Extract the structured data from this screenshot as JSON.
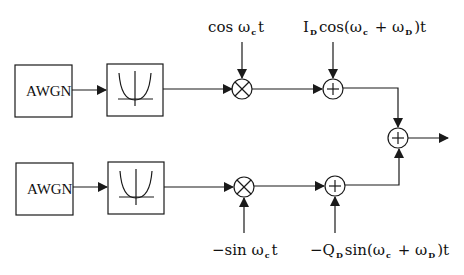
{
  "diagram": {
    "type": "block-diagram",
    "colors": {
      "stroke": "#1a1a1a",
      "background": "#ffffff"
    },
    "top_branch": {
      "noise_source": {
        "label": "AWGN"
      },
      "filter": {
        "icon": "bandpass-filter-icon"
      },
      "mixer": {
        "symbol": "×",
        "input_label": {
          "pre": "cos ω",
          "sub": "c",
          "post": "t"
        }
      },
      "adder": {
        "symbol": "+",
        "input_label": {
          "p1": "I",
          "s1": "D",
          "p2": "cos(ω",
          "s2": "c",
          "p3": " + ω",
          "s3": "D",
          "p4": ")t"
        }
      }
    },
    "bottom_branch": {
      "noise_source": {
        "label": "AWGN"
      },
      "filter": {
        "icon": "bandpass-filter-icon"
      },
      "mixer": {
        "symbol": "×",
        "input_label": {
          "pre": "−sin ω",
          "sub": "c",
          "post": "t"
        }
      },
      "adder": {
        "symbol": "+",
        "input_label": {
          "p1": "−Q",
          "s1": "D",
          "p2": "sin(ω",
          "s2": "c",
          "p3": " + ω",
          "s3": "D",
          "p4": ")t"
        }
      }
    },
    "output_adder": {
      "symbol": "+"
    }
  }
}
